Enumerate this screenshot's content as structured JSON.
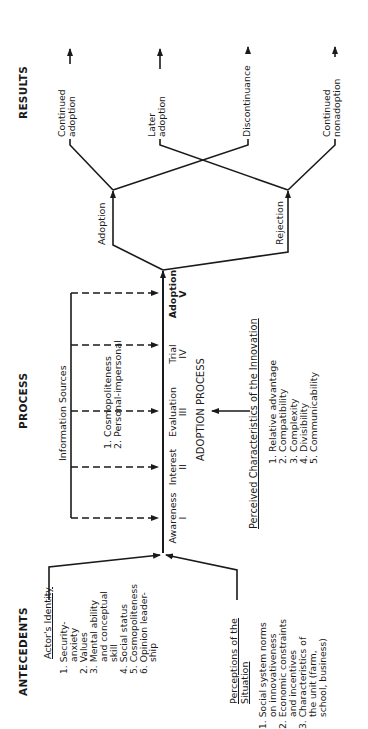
{
  "sections": {
    "antecedents": "ANTECEDENTS",
    "process": "PROCESS",
    "results": "RESULTS"
  },
  "actors_identity": {
    "title": "Actor's Identity",
    "items": [
      {
        "num": "1.",
        "lines": [
          "Security-",
          "anxiety"
        ]
      },
      {
        "num": "2.",
        "lines": [
          "Values"
        ]
      },
      {
        "num": "3.",
        "lines": [
          "Mental ability",
          "and conceptual",
          "skill"
        ]
      },
      {
        "num": "4.",
        "lines": [
          "Social status"
        ]
      },
      {
        "num": "5.",
        "lines": [
          "Cosmopoliteness"
        ]
      },
      {
        "num": "6.",
        "lines": [
          "Opinion leader-",
          "ship"
        ]
      }
    ]
  },
  "perceptions_situation": {
    "title_line1": "Perceptions of the",
    "title_line2": "Situation",
    "items": [
      {
        "num": "1.",
        "lines": [
          "Social system norms",
          "on innovativeness"
        ]
      },
      {
        "num": "2.",
        "lines": [
          "Economic constraints",
          "and incentives"
        ]
      },
      {
        "num": "3.",
        "lines": [
          "Characteristics of",
          "the unit (farm,",
          "school, business)"
        ]
      }
    ]
  },
  "information_sources": {
    "title": "Information Sources",
    "items": [
      "1. Cosmopoliteness",
      "2. Personal-impersonal"
    ]
  },
  "adoption_process": {
    "title": "ADOPTION PROCESS",
    "stages": [
      {
        "name": "Awareness",
        "numeral": "I"
      },
      {
        "name": "Interest",
        "numeral": "II"
      },
      {
        "name": "Evaluation",
        "numeral": "III"
      },
      {
        "name": "Trial",
        "numeral": "IV"
      },
      {
        "name": "Adoption",
        "numeral": "V"
      }
    ]
  },
  "perceived_characteristics": {
    "title": "Perceived Characteristics of the Innovation",
    "items": [
      "1. Relative advantage",
      "2. Compatibility",
      "3. Complexity",
      "4. Divisibility",
      "5. Communicability"
    ]
  },
  "decisions": {
    "adoption": "Adoption",
    "rejection": "Rejection"
  },
  "results": {
    "continued_adoption": [
      "Continued",
      "adoption"
    ],
    "later_adoption": [
      "Later",
      "adoption"
    ],
    "discontinuance": "Discontinuance",
    "continued_nonadoption": [
      "Continued",
      "nonadoption"
    ]
  },
  "colors": {
    "ink": "#1a1a1a",
    "background": "#ffffff"
  }
}
